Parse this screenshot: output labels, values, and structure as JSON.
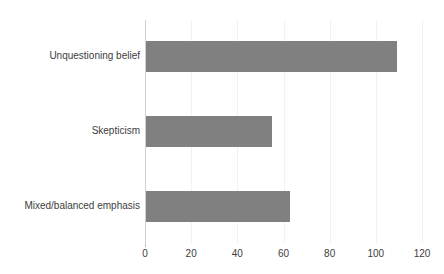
{
  "chart_data": {
    "type": "bar",
    "orientation": "horizontal",
    "title": "",
    "subtitle": "",
    "xlabel": "",
    "ylabel": "",
    "categories": [
      "Unquestioning belief",
      "Skepticism",
      "Mixed/balanced emphasis"
    ],
    "values": [
      109,
      55,
      63
    ],
    "series": [
      {
        "name": "",
        "values": [
          109,
          55,
          63
        ]
      }
    ],
    "xlim": [
      0,
      120
    ],
    "xticks": [
      0,
      20,
      40,
      60,
      80,
      100,
      120
    ],
    "xtick_labels": [
      "0",
      "20",
      "40",
      "60",
      "80",
      "100",
      "120"
    ],
    "grid": true,
    "grid_axis": "x",
    "legend": false,
    "legend_position": "none",
    "annotations": [],
    "colors": {
      "bar": "#808080",
      "gridline": "#f2f2f2",
      "axis_spine": "#d0d0d0",
      "text": "#3d3d3d",
      "background": "#ffffff"
    }
  }
}
